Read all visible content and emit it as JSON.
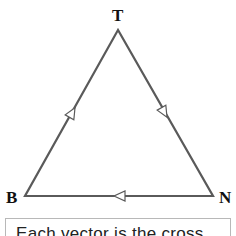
{
  "diagram": {
    "type": "vector-triangle",
    "vertices": [
      {
        "label": "T",
        "x": 118,
        "y": 30
      },
      {
        "label": "B",
        "x": 25,
        "y": 196
      },
      {
        "label": "N",
        "x": 213,
        "y": 196
      }
    ],
    "edges": [
      {
        "from": "B",
        "to": "T",
        "arrow": "open-triangle"
      },
      {
        "from": "T",
        "to": "N",
        "arrow": "open-triangle"
      },
      {
        "from": "N",
        "to": "B",
        "arrow": "open-triangle"
      }
    ],
    "line_color": "#5a5a5a"
  },
  "labels": {
    "t": "T",
    "b": "B",
    "n": "N"
  },
  "caption": {
    "text": "Each vector is the cross"
  }
}
